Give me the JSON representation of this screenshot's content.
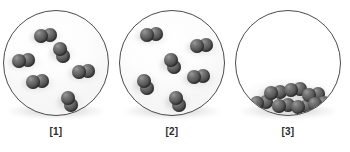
{
  "figure": {
    "background_color": "#ffffff",
    "vessel_outline_color": "#4b4b4b",
    "molecule_color": "#4a4a4a",
    "molecule_highlight_color": "#9a9a9a"
  },
  "panels": [
    {
      "id": "panel-1",
      "label": "[1]",
      "molecule_count": 6,
      "arrangement": "dispersed",
      "molecules": [
        {
          "x": 30,
          "y": 17,
          "orientation": "horizontal"
        },
        {
          "x": 47,
          "y": 31,
          "orientation": "vertical"
        },
        {
          "x": 8,
          "y": 42,
          "orientation": "horizontal"
        },
        {
          "x": 68,
          "y": 53,
          "orientation": "horizontal"
        },
        {
          "x": 22,
          "y": 63,
          "orientation": "horizontal"
        },
        {
          "x": 55,
          "y": 80,
          "orientation": "vertical"
        }
      ]
    },
    {
      "id": "panel-2",
      "label": "[2]",
      "molecule_count": 6,
      "arrangement": "dispersed",
      "molecules": [
        {
          "x": 20,
          "y": 16,
          "orientation": "horizontal"
        },
        {
          "x": 70,
          "y": 27,
          "orientation": "horizontal"
        },
        {
          "x": 42,
          "y": 42,
          "orientation": "vertical"
        },
        {
          "x": 67,
          "y": 58,
          "orientation": "horizontal"
        },
        {
          "x": 15,
          "y": 63,
          "orientation": "vertical"
        },
        {
          "x": 47,
          "y": 80,
          "orientation": "vertical"
        }
      ]
    },
    {
      "id": "panel-3",
      "label": "[3]",
      "molecule_count": 7,
      "arrangement": "clustered-at-bottom",
      "molecules": [
        {
          "x": 28,
          "y": 74,
          "orientation": "horizontal"
        },
        {
          "x": 48,
          "y": 71,
          "orientation": "horizontal"
        },
        {
          "x": 66,
          "y": 76,
          "orientation": "horizontal"
        },
        {
          "x": 14,
          "y": 84,
          "orientation": "horizontal"
        },
        {
          "x": 36,
          "y": 87,
          "orientation": "horizontal"
        },
        {
          "x": 55,
          "y": 88,
          "orientation": "horizontal"
        },
        {
          "x": 72,
          "y": 85,
          "orientation": "horizontal"
        }
      ]
    }
  ]
}
